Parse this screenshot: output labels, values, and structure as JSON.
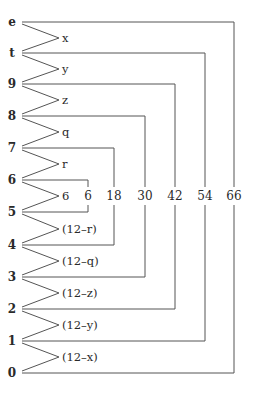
{
  "nodes": [
    {
      "label": "e",
      "y": 22
    },
    {
      "label": "t",
      "y": 53
    },
    {
      "label": "9",
      "y": 84
    },
    {
      "label": "8",
      "y": 116
    },
    {
      "label": "7",
      "y": 148
    },
    {
      "label": "6",
      "y": 180
    },
    {
      "label": "5",
      "y": 212
    },
    {
      "label": "4",
      "y": 245
    },
    {
      "label": "3",
      "y": 277
    },
    {
      "label": "2",
      "y": 309
    },
    {
      "label": "1",
      "y": 341
    },
    {
      "label": "0",
      "y": 373
    }
  ],
  "edges": [
    {
      "label": "x",
      "y": 38
    },
    {
      "label": "y",
      "y": 69
    },
    {
      "label": "z",
      "y": 100
    },
    {
      "label": "q",
      "y": 132
    },
    {
      "label": "r",
      "y": 164
    },
    {
      "label": "6",
      "y": 196
    },
    {
      "label": "(12–r)",
      "y": 229
    },
    {
      "label": "(12–q)",
      "y": 261
    },
    {
      "label": "(12–z)",
      "y": 293
    },
    {
      "label": "(12–y)",
      "y": 325
    },
    {
      "label": "(12–x)",
      "y": 357
    }
  ],
  "brackets": [
    {
      "label": "6",
      "x": 88,
      "top": 180,
      "bottom": 212
    },
    {
      "label": "18",
      "x": 114,
      "top": 148,
      "bottom": 245
    },
    {
      "label": "30",
      "x": 145,
      "top": 116,
      "bottom": 277
    },
    {
      "label": "42",
      "x": 175,
      "top": 84,
      "bottom": 309
    },
    {
      "label": "54",
      "x": 205,
      "top": 53,
      "bottom": 341
    },
    {
      "label": "66",
      "x": 234,
      "top": 22,
      "bottom": 373
    }
  ],
  "label_row_y": 196
}
